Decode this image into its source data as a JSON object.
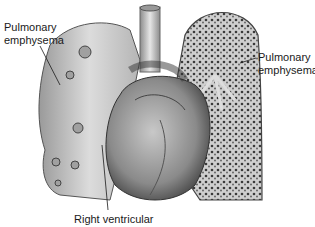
{
  "figure": {
    "labels": {
      "left": {
        "line1": "Pulmonary",
        "line2": "emphysema"
      },
      "right": {
        "line1": "Pulmonary",
        "line2": "emphysema"
      },
      "bottom": {
        "text": "Right ventricular"
      }
    },
    "colors": {
      "background": "#ffffff",
      "ink": "#1a1a1a",
      "tissue_light": "#d9d9d9",
      "tissue_mid": "#a8a8a8",
      "tissue_dark": "#555555"
    }
  }
}
